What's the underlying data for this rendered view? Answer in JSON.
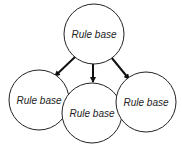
{
  "diagram": {
    "nodes": [
      {
        "id": "root",
        "label": "Rule base",
        "cx": 94,
        "cy": 34,
        "r": 30
      },
      {
        "id": "left",
        "label": "Rule base",
        "cx": 39,
        "cy": 100,
        "r": 30
      },
      {
        "id": "middle",
        "label": "Rule base",
        "cx": 92,
        "cy": 113,
        "r": 30
      },
      {
        "id": "right",
        "label": "Rule base",
        "cx": 146,
        "cy": 102,
        "r": 30
      }
    ],
    "edges": [
      {
        "from": "root",
        "to": "left"
      },
      {
        "from": "root",
        "to": "middle"
      },
      {
        "from": "root",
        "to": "right"
      }
    ]
  }
}
